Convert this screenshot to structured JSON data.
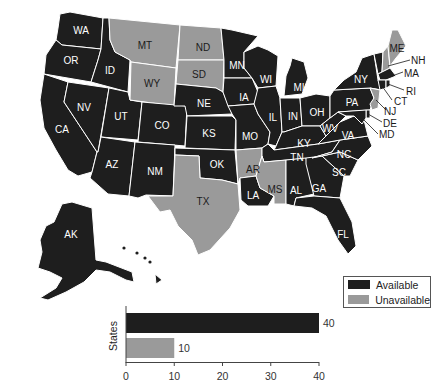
{
  "colors": {
    "available": "#1e1e1e",
    "unavailable": "#9a9a9a",
    "border": "#ffffff"
  },
  "legend": {
    "items": [
      {
        "label": "Available",
        "color": "#1e1e1e"
      },
      {
        "label": "Unavailable",
        "color": "#9a9a9a"
      }
    ]
  },
  "map": {
    "states": {
      "WA": "available",
      "OR": "available",
      "CA": "available",
      "ID": "available",
      "NV": "available",
      "UT": "available",
      "AZ": "available",
      "MT": "unavailable",
      "WY": "unavailable",
      "CO": "available",
      "NM": "available",
      "ND": "unavailable",
      "SD": "unavailable",
      "NE": "available",
      "KS": "available",
      "OK": "available",
      "TX": "unavailable",
      "MN": "available",
      "IA": "available",
      "MO": "available",
      "AR": "unavailable",
      "LA": "available",
      "WI": "available",
      "IL": "available",
      "MI": "available",
      "IN": "available",
      "OH": "available",
      "KY": "available",
      "TN": "available",
      "MS": "unavailable",
      "AL": "available",
      "GA": "available",
      "FL": "available",
      "SC": "available",
      "NC": "available",
      "VA": "available",
      "WV": "available",
      "PA": "available",
      "NY": "available",
      "VT": "available",
      "NH": "unavailable",
      "ME": "unavailable",
      "MA": "available",
      "RI": "available",
      "CT": "available",
      "NJ": "unavailable",
      "DE": "available",
      "MD": "available",
      "AK": "available",
      "HI": "available"
    },
    "labels": {
      "WA": "WA",
      "OR": "OR",
      "CA": "CA",
      "ID": "ID",
      "NV": "NV",
      "UT": "UT",
      "AZ": "AZ",
      "MT": "MT",
      "WY": "WY",
      "CO": "CO",
      "NM": "NM",
      "ND": "ND",
      "SD": "SD",
      "NE": "NE",
      "KS": "KS",
      "OK": "OK",
      "TX": "TX",
      "MN": "MN",
      "IA": "IA",
      "MO": "MO",
      "AR": "AR",
      "LA": "LA",
      "WI": "WI",
      "IL": "IL",
      "MI": "MI",
      "IN": "IN",
      "OH": "OH",
      "KY": "KY",
      "TN": "TN",
      "MS": "MS",
      "AL": "AL",
      "GA": "GA",
      "FL": "FL",
      "SC": "SC",
      "NC": "NC",
      "VA": "VA",
      "WV": "WV",
      "PA": "PA",
      "NY": "NY",
      "VT": "VT",
      "NH": "NH",
      "ME": "ME",
      "MA": "MA",
      "RI": "RI",
      "CT": "CT",
      "NJ": "NJ",
      "DE": "DE",
      "MD": "MD",
      "AK": "AK",
      "HI": "HI"
    }
  },
  "chart_data": {
    "type": "bar",
    "orientation": "horizontal",
    "categories": [
      "Available",
      "Unavailable"
    ],
    "values": [
      40,
      10
    ],
    "colors": [
      "#1e1e1e",
      "#9a9a9a"
    ],
    "title": "",
    "xlabel": "",
    "ylabel": "States",
    "xlim": [
      0,
      40
    ],
    "xticks": [
      "0",
      "10",
      "20",
      "30",
      "40"
    ],
    "data_labels": [
      "40",
      "10"
    ],
    "grid": false
  }
}
